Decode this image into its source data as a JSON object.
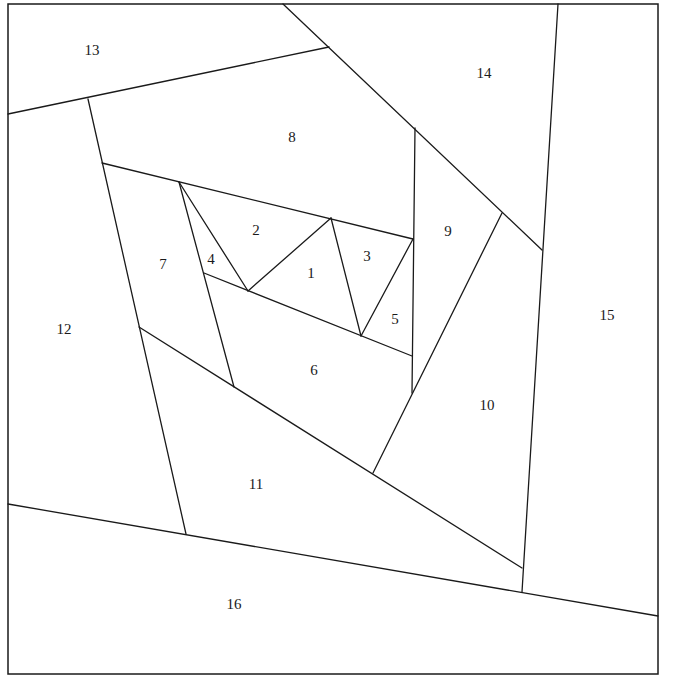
{
  "diagram": {
    "type": "numbered polygon piecing diagram",
    "frame": {
      "x1": 8,
      "y1": 4,
      "x2": 658,
      "y2": 674
    },
    "line_color": "#1a1a1a",
    "background": "#ffffff",
    "segments": [
      {
        "id": "s13-8",
        "x1": 8,
        "y1": 114,
        "x2": 329,
        "y2": 47
      },
      {
        "id": "s8-14",
        "x1": 283,
        "y1": 4,
        "x2": 542,
        "y2": 250
      },
      {
        "id": "s14-15",
        "x1": 558,
        "y1": 4,
        "x2": 522,
        "y2": 592
      },
      {
        "id": "s12-7",
        "x1": 88,
        "y1": 99,
        "x2": 186,
        "y2": 534
      },
      {
        "id": "s8-7top",
        "x1": 102,
        "y1": 163,
        "x2": 413,
        "y2": 239
      },
      {
        "id": "s9-left",
        "x1": 415,
        "y1": 128,
        "x2": 412,
        "y2": 393
      },
      {
        "id": "s9-10",
        "x1": 502,
        "y1": 213,
        "x2": 373,
        "y2": 473
      },
      {
        "id": "s11-top",
        "x1": 139,
        "y1": 327,
        "x2": 522,
        "y2": 568
      },
      {
        "id": "s16-top",
        "x1": 8,
        "y1": 504,
        "x2": 658,
        "y2": 616
      },
      {
        "id": "s7-6",
        "x1": 179,
        "y1": 182,
        "x2": 234,
        "y2": 387
      },
      {
        "id": "s2-4",
        "x1": 179,
        "y1": 182,
        "x2": 248,
        "y2": 291
      },
      {
        "id": "s4-6",
        "x1": 204,
        "y1": 273,
        "x2": 412,
        "y2": 356
      },
      {
        "id": "s2-1",
        "x1": 248,
        "y1": 291,
        "x2": 331,
        "y2": 218
      },
      {
        "id": "s1-3",
        "x1": 331,
        "y1": 218,
        "x2": 361,
        "y2": 336
      },
      {
        "id": "s3-5",
        "x1": 361,
        "y1": 336,
        "x2": 413,
        "y2": 239
      }
    ],
    "regions": [
      {
        "label": "1",
        "x": 311,
        "y": 275
      },
      {
        "label": "2",
        "x": 256,
        "y": 232
      },
      {
        "label": "3",
        "x": 367,
        "y": 258
      },
      {
        "label": "4",
        "x": 211,
        "y": 261
      },
      {
        "label": "5",
        "x": 395,
        "y": 321
      },
      {
        "label": "6",
        "x": 314,
        "y": 372
      },
      {
        "label": "7",
        "x": 163,
        "y": 266
      },
      {
        "label": "8",
        "x": 292,
        "y": 139
      },
      {
        "label": "9",
        "x": 448,
        "y": 233
      },
      {
        "label": "10",
        "x": 487,
        "y": 407
      },
      {
        "label": "11",
        "x": 256,
        "y": 486
      },
      {
        "label": "12",
        "x": 64,
        "y": 331
      },
      {
        "label": "13",
        "x": 92,
        "y": 52
      },
      {
        "label": "14",
        "x": 484,
        "y": 75
      },
      {
        "label": "15",
        "x": 607,
        "y": 317
      },
      {
        "label": "16",
        "x": 234,
        "y": 606
      }
    ]
  }
}
